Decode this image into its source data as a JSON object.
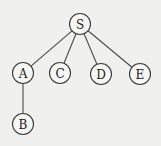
{
  "diagram": {
    "type": "tree",
    "nodes": [
      {
        "id": "S",
        "label": "S",
        "x": 80,
        "y": 24
      },
      {
        "id": "A",
        "label": "A",
        "x": 23,
        "y": 73
      },
      {
        "id": "C",
        "label": "C",
        "x": 60,
        "y": 73
      },
      {
        "id": "D",
        "label": "D",
        "x": 101,
        "y": 74
      },
      {
        "id": "E",
        "label": "E",
        "x": 140,
        "y": 74
      },
      {
        "id": "B",
        "label": "B",
        "x": 23,
        "y": 124
      }
    ],
    "edges": [
      {
        "from": "S",
        "to": "A"
      },
      {
        "from": "S",
        "to": "C"
      },
      {
        "from": "S",
        "to": "D"
      },
      {
        "from": "S",
        "to": "E"
      },
      {
        "from": "A",
        "to": "B"
      }
    ],
    "node_radius": 10.5
  }
}
